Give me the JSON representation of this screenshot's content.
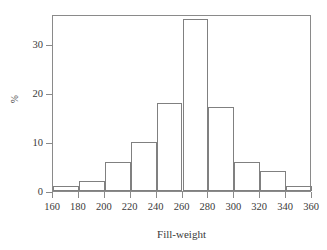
{
  "chart_data": {
    "type": "bar",
    "title": "",
    "subtitle": "",
    "xlabel": "Fill-weight",
    "ylabel": "%",
    "categories": [
      "160-180",
      "180-200",
      "200-220",
      "220-240",
      "240-260",
      "260-280",
      "280-300",
      "300-320",
      "320-340",
      "340-360"
    ],
    "bin_edges": [
      160,
      180,
      200,
      220,
      240,
      260,
      280,
      300,
      320,
      340,
      360
    ],
    "bin_width": 20,
    "values": [
      1,
      2,
      6,
      10,
      17.8,
      35,
      17,
      6,
      4,
      1
    ],
    "xlim": [
      160,
      360
    ],
    "ylim": [
      0,
      36
    ],
    "xticks": [
      160,
      180,
      200,
      220,
      240,
      260,
      280,
      300,
      320,
      340,
      360
    ],
    "xtick_labels": [
      "160",
      "180",
      "200",
      "220",
      "240",
      "260",
      "280",
      "300",
      "320",
      "340",
      "360"
    ],
    "yticks": [
      0,
      10,
      20,
      30
    ],
    "ytick_labels": [
      "0",
      "10",
      "20",
      "30"
    ],
    "grid": false,
    "legend": null,
    "legend_position": "none",
    "annotations": [],
    "colors": {
      "bar_fill": "transparent",
      "bar_stroke": "#808080",
      "axis": "#8a8a8a",
      "text": "#3a3a3a",
      "background": "#ffffff"
    }
  }
}
